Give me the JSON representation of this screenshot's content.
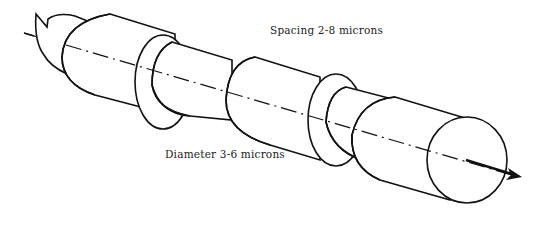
{
  "figure": {
    "type": "line-drawing",
    "labels": {
      "spacing": "Spacing 2-8 microns",
      "diameter": "Diameter 3-6 microns"
    },
    "components": [
      {
        "name": "rough-left-end"
      },
      {
        "name": "sheath-segment-1"
      },
      {
        "name": "collar-1"
      },
      {
        "name": "bare-core-1"
      },
      {
        "name": "sheath-segment-2"
      },
      {
        "name": "collar-2"
      },
      {
        "name": "bare-core-2"
      },
      {
        "name": "sheath-segment-3"
      }
    ],
    "axis": {
      "style": "dash-dot",
      "direction": "arrow-right"
    },
    "colors": {
      "line": "#111111",
      "background": "#ffffff"
    }
  }
}
